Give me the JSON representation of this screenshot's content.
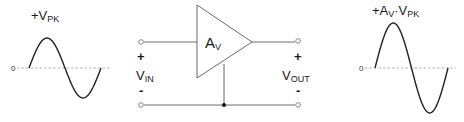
{
  "diagram": {
    "input_waveform": {
      "peak_label_prefix": "+V",
      "peak_label_sub": "PK",
      "zero_label": "0"
    },
    "amplifier": {
      "gain_label": "A",
      "gain_sub": "V"
    },
    "input_port": {
      "plus": "+",
      "label": "V",
      "label_sub": "IN",
      "minus": "-"
    },
    "output_port": {
      "plus": "+",
      "label": "V",
      "label_sub": "OUT",
      "minus": "-"
    },
    "output_waveform": {
      "peak_label_part1": "+A",
      "peak_label_sub1": "V",
      "peak_label_dot": "·V",
      "peak_label_sub2": "PK",
      "zero_label": "0"
    }
  }
}
